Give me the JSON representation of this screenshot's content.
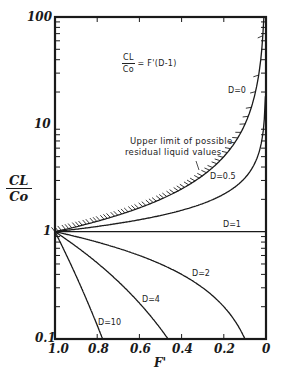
{
  "chart_data": {
    "type": "line",
    "title": "",
    "equation": {
      "lhs_num": "CL",
      "lhs_den": "Co",
      "rhs": "= F'(D-1)"
    },
    "xlabel": "F'",
    "ylabel": {
      "num": "CL",
      "den": "Co"
    },
    "xlim": [
      1.0,
      0
    ],
    "ylim": [
      0.1,
      100
    ],
    "yscale": "log",
    "x_ticks": [
      "1.0",
      "0.8",
      "0.6",
      "0.4",
      "0.2",
      "0"
    ],
    "y_ticks": [
      "0.1",
      "1",
      "10",
      "100"
    ],
    "grid": false,
    "legend": "none",
    "annotation": {
      "line1": "Upper limit of possible",
      "line2": "residual liquid values"
    },
    "series": [
      {
        "name": "D=0",
        "D": 0,
        "hatched": true,
        "x": [
          1.0,
          0.8,
          0.6,
          0.4,
          0.2,
          0.1,
          0.05,
          0.02,
          0.01
        ],
        "values": [
          1,
          1.25,
          1.67,
          2.5,
          5,
          10,
          20,
          50,
          100
        ]
      },
      {
        "name": "D=0.5",
        "D": 0.5,
        "x": [
          1.0,
          0.8,
          0.6,
          0.4,
          0.2,
          0.1,
          0.05,
          0.02,
          0.003
        ],
        "values": [
          1,
          1.12,
          1.29,
          1.58,
          2.24,
          3.16,
          4.47,
          7.07,
          18.3
        ]
      },
      {
        "name": "D=1",
        "D": 1,
        "x": [
          1.0,
          0
        ],
        "values": [
          1,
          1
        ]
      },
      {
        "name": "D=2",
        "D": 2,
        "x": [
          1.0,
          0.8,
          0.6,
          0.4,
          0.2,
          0.1
        ],
        "values": [
          1,
          0.8,
          0.6,
          0.4,
          0.2,
          0.1
        ]
      },
      {
        "name": "D=4",
        "D": 4,
        "x": [
          1.0,
          0.9,
          0.8,
          0.7,
          0.6,
          0.5,
          0.464
        ],
        "values": [
          1,
          0.729,
          0.512,
          0.343,
          0.216,
          0.125,
          0.1
        ]
      },
      {
        "name": "D=10",
        "D": 10,
        "x": [
          1.0,
          0.95,
          0.9,
          0.85,
          0.8,
          0.774
        ],
        "values": [
          1,
          0.63,
          0.387,
          0.232,
          0.134,
          0.1
        ]
      }
    ]
  },
  "labels": {
    "d0": "D=0",
    "d05": "D=0.5",
    "d1": "D=1",
    "d2": "D=2",
    "d4": "D=4",
    "d10": "D=10",
    "eq_num": "CL",
    "eq_den": "Co",
    "eq_rhs": "= F'(D-1)",
    "y_num": "CL",
    "y_den": "Co",
    "xlabel": "F'",
    "note1": "Upper limit of possible",
    "note2": "residual liquid values",
    "y100": "100",
    "y10": "10",
    "y1": "1",
    "y01": "0.1",
    "x10": "1.0",
    "x08": "0.8",
    "x06": "0.6",
    "x04": "0.4",
    "x02": "0.2",
    "x0": "0"
  }
}
